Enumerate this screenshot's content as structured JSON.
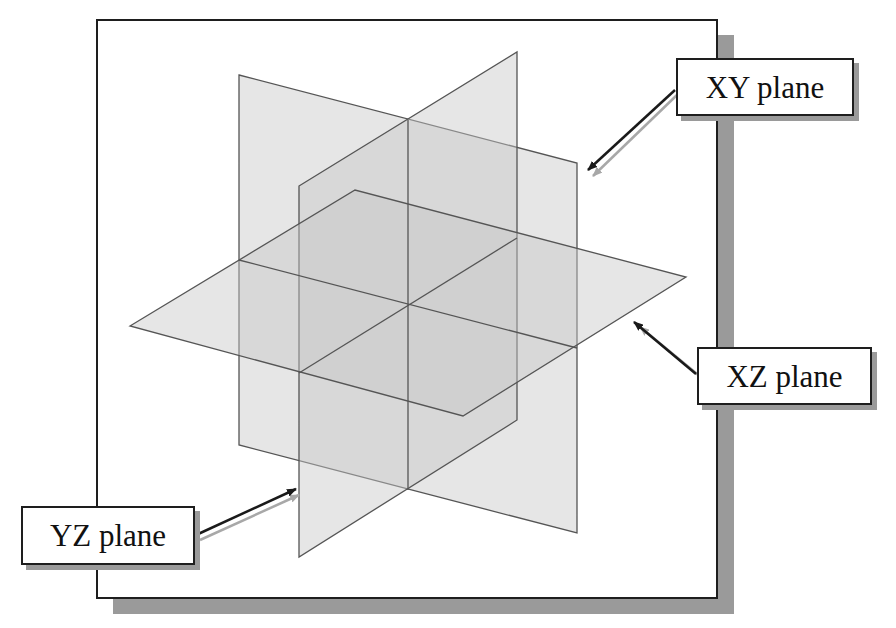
{
  "diagram": {
    "labels": {
      "xy": "XY plane",
      "xz": "XZ plane",
      "yz": "YZ plane"
    },
    "colors": {
      "plane_fill": "#c8c8c8",
      "plane_edge": "#555555",
      "frame_border": "#1e1e1e",
      "shadow": "#9a9a9a",
      "arrow": "#1a1a1a"
    },
    "planes": [
      {
        "name": "XY plane",
        "corners": [
          [
            239,
            75
          ],
          [
            577,
            163
          ],
          [
            577,
            533
          ],
          [
            239,
            445
          ]
        ]
      },
      {
        "name": "YZ plane",
        "corners": [
          [
            299,
            186
          ],
          [
            517,
            52
          ],
          [
            517,
            420
          ],
          [
            299,
            557
          ]
        ]
      },
      {
        "name": "XZ plane",
        "corners": [
          [
            130,
            326
          ],
          [
            355,
            190
          ],
          [
            686,
            277
          ],
          [
            463,
            416
          ]
        ]
      }
    ]
  }
}
